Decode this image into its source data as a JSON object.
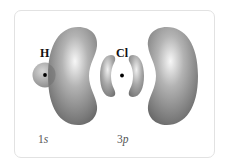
{
  "diagram": {
    "atoms": [
      {
        "symbol": "H",
        "orbital": {
          "number": "1",
          "letter": "s"
        }
      },
      {
        "symbol": "Cl",
        "orbital": {
          "number": "3",
          "letter": "p"
        }
      }
    ],
    "colors": {
      "lobe_dark": "#6a6a6a",
      "lobe_mid": "#9a9a9a",
      "lobe_light": "#f2f2f2",
      "frame_border": "#e2e2e2",
      "nucleus": "#000000"
    }
  }
}
